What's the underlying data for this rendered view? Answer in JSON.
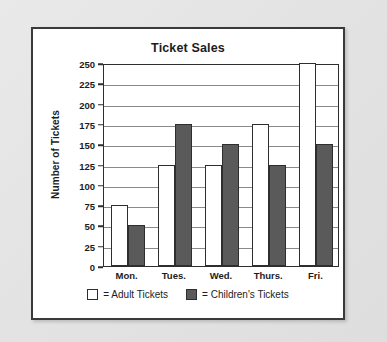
{
  "chart_data": {
    "type": "bar",
    "title": "Ticket Sales",
    "xlabel": "",
    "ylabel": "Number of Tickets",
    "categories": [
      "Mon.",
      "Tues.",
      "Wed.",
      "Thurs.",
      "Fri."
    ],
    "series": [
      {
        "name": "= Adult Tickets",
        "key": "adult",
        "color": "#ffffff",
        "values": [
          75,
          125,
          125,
          175,
          250
        ]
      },
      {
        "name": "= Children's Tickets",
        "key": "children",
        "color": "#5a5a5a",
        "values": [
          50,
          175,
          150,
          125,
          150
        ]
      }
    ],
    "ylim": [
      0,
      250
    ],
    "ytick_step": 25,
    "yticks": [
      250,
      225,
      200,
      175,
      150,
      125,
      100,
      75,
      50,
      25,
      0
    ],
    "ytick_labels": [
      "250",
      "225",
      "200",
      "175",
      "150",
      "125",
      "100",
      "75",
      "50",
      "25",
      "0"
    ],
    "grid": true,
    "grid_axis": "y",
    "legend_position": "bottom"
  },
  "legend": {
    "items": [
      {
        "label": "= Adult Tickets",
        "swatch": "adult"
      },
      {
        "label": "= Children's Tickets",
        "swatch": "children"
      }
    ]
  },
  "colors": {
    "page_background": "#e4e4e4",
    "card_background": "#ffffff",
    "frame": "#3a3a3a",
    "axis": "#2e2e2e",
    "gridline": "#8a8a8a",
    "text": "#1c1c1c",
    "adult_fill": "#ffffff",
    "children_fill": "#5a5a5a"
  }
}
